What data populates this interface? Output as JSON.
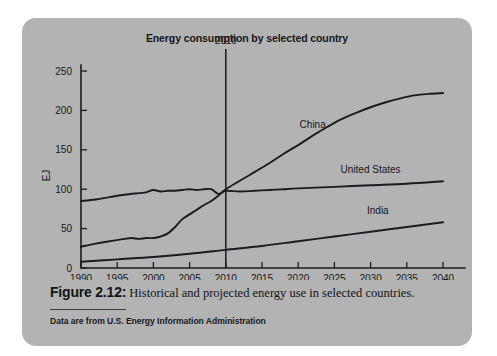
{
  "figure": {
    "caption_label": "Figure 2.12:",
    "caption_text": "Historical and projected energy use in selected countries.",
    "source_note": "Data are from U.S. Energy Information Administration",
    "panel_color": "#b3b3b3",
    "ink_color": "#17191c"
  },
  "chart_data": {
    "type": "line",
    "title": "Energy consumption by selected country",
    "xlabel": "",
    "ylabel": "EJ",
    "xlim": [
      1990,
      2040
    ],
    "ylim": [
      0,
      250
    ],
    "xticks": [
      1990,
      1995,
      2000,
      2005,
      2010,
      2015,
      2020,
      2025,
      2030,
      2035,
      2040
    ],
    "yticks": [
      0,
      50,
      100,
      150,
      200,
      250
    ],
    "xtick_labels": [
      "1990",
      "1995",
      "2000",
      "2005",
      "2010",
      "2015",
      "2020",
      "2025",
      "2030",
      "2035",
      "2040"
    ],
    "ytick_labels": [
      "0",
      "50",
      "100",
      "150",
      "200",
      "250"
    ],
    "grid": false,
    "legend": "inline-labels",
    "annotations": [
      {
        "name": "projection-divider",
        "label": "2010",
        "x": 2010,
        "type": "vertical-line",
        "label_position": "above-axis"
      }
    ],
    "series": [
      {
        "name": "China",
        "label": "China",
        "label_x": 2022,
        "label_y": 178,
        "x": [
          1990,
          1992,
          1994,
          1996,
          1997,
          1998,
          1999,
          2000,
          2001,
          2002,
          2003,
          2004,
          2005,
          2006,
          2007,
          2008,
          2009,
          2010,
          2012,
          2014,
          2016,
          2018,
          2020,
          2022,
          2024,
          2026,
          2028,
          2030,
          2032,
          2034,
          2036,
          2038,
          2040
        ],
        "values": [
          27,
          31,
          34,
          37,
          38,
          37,
          38,
          38,
          40,
          44,
          52,
          62,
          68,
          74,
          80,
          85,
          92,
          100,
          111,
          122,
          133,
          145,
          156,
          168,
          179,
          189,
          197,
          204,
          210,
          215,
          219,
          221,
          222
        ]
      },
      {
        "name": "United States",
        "label": "United States",
        "label_x": 2030,
        "label_y": 120,
        "x": [
          1990,
          1992,
          1994,
          1996,
          1998,
          1999,
          2000,
          2001,
          2002,
          2003,
          2004,
          2005,
          2006,
          2007,
          2008,
          2009,
          2010,
          2012,
          2014,
          2016,
          2018,
          2020,
          2025,
          2030,
          2035,
          2040
        ],
        "values": [
          85,
          87,
          90,
          93,
          95,
          96,
          99,
          97,
          98,
          98,
          99,
          100,
          99,
          100,
          100,
          94,
          98,
          97,
          98,
          99,
          100,
          101,
          103,
          105,
          107,
          110
        ]
      },
      {
        "name": "India",
        "label": "India",
        "label_x": 2031,
        "label_y": 68,
        "x": [
          1990,
          1995,
          2000,
          2005,
          2010,
          2015,
          2020,
          2025,
          2030,
          2035,
          2040
        ],
        "values": [
          8,
          11,
          14,
          18,
          23,
          28,
          34,
          40,
          46,
          52,
          58
        ]
      }
    ]
  }
}
